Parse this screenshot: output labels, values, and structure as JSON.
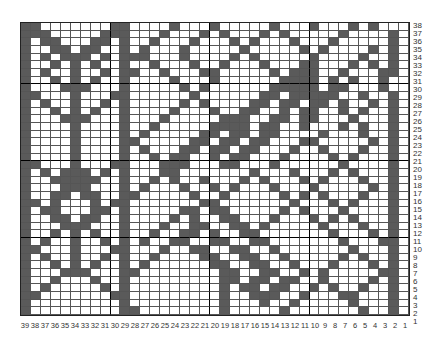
{
  "chart_data": {
    "type": "heatmap",
    "title": "",
    "columns": 39,
    "rows": 38,
    "col_labels": [
      "39",
      "38",
      "37",
      "36",
      "35",
      "34",
      "33",
      "32",
      "31",
      "30",
      "29",
      "28",
      "27",
      "26",
      "25",
      "24",
      "23",
      "22",
      "21",
      "20",
      "19",
      "18",
      "17",
      "16",
      "15",
      "14",
      "13",
      "12",
      "11",
      "10",
      "9",
      "8",
      "7",
      "6",
      "5",
      "4",
      "3",
      "2",
      "1"
    ],
    "row_labels": [
      "38",
      "37",
      "36",
      "35",
      "34",
      "33",
      "32",
      "31",
      "30",
      "29",
      "28",
      "27",
      "26",
      "25",
      "24",
      "23",
      "22",
      "21",
      "20",
      "19",
      "18",
      "17",
      "16",
      "15",
      "14",
      "13",
      "12",
      "11",
      "10",
      "9",
      "8",
      "7",
      "6",
      "5",
      "4",
      "3",
      "2",
      "1"
    ],
    "fill_color": "#5a5a5a",
    "empty_color": "#ffffff",
    "grid_rows_top_to_bottom": [
      "##.......##....#...#.....#...#...#.#..",
      "###.....###...#...#.#...#.#.....#....#",
      "#.##...##.#..#...#...#.#...#...#.....#",
      "#..##.##..#.#...#.....#.....#.#....#.#",
      "#.#.###.#.###...#....#.#.....#....#..#",
      "#..#.#.#..#..#...#..#...#...##...#.#.#",
      "#.#..#..#.##..#...##.....#.###..#...##",
      "#..#.#.#..#....#...#......####.#.#..#.",
      "#...###...#.....#.#......#####.##...#.",
      "##...#...##......#......##.#####..#..#",
      "#.#..#..#.#.....#.#....##.##.##.#..#.#",
      "#..#.#.#..#....#...#..##..#.##..#.#..#",
      "#...###...#...#.....###..##.##...#...#",
      "#....#....#..#.....####.##..#...#.#..#",
      "#....#....#.#.....##.##.##....#...#..#",
      "#....#....##.....##.##.##...##.....#.#",
      "#....#....#.#...##.##.##...#..#...#..#",
      "#....#....#..#.##..#.##...#....#.#...#",
      "##...#...##...###...##...#......#....#",
      "#.#.###.#.#...##.......#...#...#.#...#",
      "#..#####..#..#.#..#...#.#...#.#...#..#",
      "#...###...#.#...#..#.#...#...#.....#.#",
      "#..##.##..##.....#..#.....#.#.#...#..#",
      "##.#...#.##.......##.......#...#.#...#",
      "#.##...##.#.....##.##.....#.#...#....#",
      "#..##.##..#....#.#..##...#...#.#.#...#",
      "#...###...#...#..##..##.#.....#...#..#",
      "#..#.#.#..#..#..##.#..##.......#...#.#",
      "#.#..#..#.#.#..##..##..##.......#...##",
      "##...#...##...#..##..##..#.......#...#",
      "#.#..#..#.#..#....##..##..#.....#.#..#",
      "#..#.#.#..#.#......##..##..#...#...#.#",
      "#...###...##........##..##..#.#.....##",
      "#..#...#..#.........##.##.##..#....#.#",
      "#.#.....#.#.........#.##.##..#.#..#..#",
      "##.......##.........#..###..#...##...#",
      "#.........#.........#...#..#.....#...#",
      "#.........##........#.....#.......#..#"
    ]
  }
}
